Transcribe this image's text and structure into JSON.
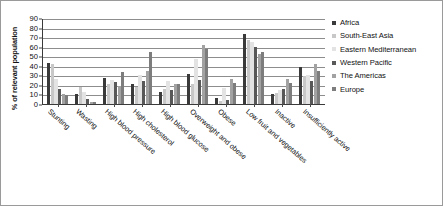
{
  "chart_data": {
    "type": "bar",
    "title": "",
    "xlabel": "",
    "ylabel": "% of relevant population",
    "ylim": [
      0,
      90
    ],
    "yticks": [
      0,
      10,
      20,
      30,
      40,
      50,
      60,
      70,
      80,
      90
    ],
    "grid": true,
    "legend_position": "right",
    "categories": [
      "Stunting",
      "Wasting",
      "High blood pressure",
      "High cholesterol",
      "High blood glucose",
      "Overweight and obese",
      "Obese",
      "Low fruit and vegetables",
      "Inactive",
      "Insufficiently active"
    ],
    "series": [
      {
        "name": "Africa",
        "color": "#3a3a3a",
        "values": [
          43,
          11,
          27,
          21,
          13,
          31,
          6,
          73,
          11,
          39
        ]
      },
      {
        "name": "South-East Asia",
        "color": "#c8c8c8",
        "values": [
          42,
          18,
          21,
          18,
          16,
          21,
          3,
          67,
          12,
          29
        ]
      },
      {
        "name": "Eastern Mediterranean",
        "color": "#e3e3e3",
        "values": [
          26,
          13,
          25,
          30,
          24,
          47,
          17,
          65,
          15,
          30
        ]
      },
      {
        "name": "Western Pacific",
        "color": "#585858",
        "values": [
          16,
          5,
          23,
          24,
          15,
          25,
          4,
          60,
          16,
          24
        ]
      },
      {
        "name": "The Americas",
        "color": "#a2a2a2",
        "values": [
          10,
          2,
          19,
          35,
          21,
          62,
          26,
          52,
          26,
          42
        ]
      },
      {
        "name": "Europe",
        "color": "#7d7d7d",
        "values": [
          9,
          2,
          34,
          54,
          21,
          58,
          22,
          54,
          22,
          35
        ]
      }
    ]
  },
  "legend": {
    "items": [
      {
        "label": "Africa"
      },
      {
        "label": "South-East Asia"
      },
      {
        "label": "Eastern Mediterranean"
      },
      {
        "label": "Western Pacific"
      },
      {
        "label": "The Americas"
      },
      {
        "label": "Europe"
      }
    ]
  }
}
